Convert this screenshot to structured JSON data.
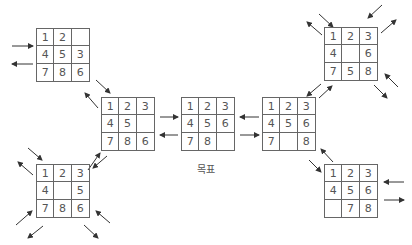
{
  "diagram": {
    "goal_label": "목표",
    "states": [
      {
        "id": "top-left",
        "x": 36,
        "y": 28,
        "cells": [
          "1",
          "2",
          "",
          "4",
          "5",
          "3",
          "7",
          "8",
          "6"
        ]
      },
      {
        "id": "left-middle",
        "x": 101,
        "y": 97,
        "cells": [
          "1",
          "2",
          "3",
          "4",
          "5",
          "",
          "7",
          "8",
          "6"
        ]
      },
      {
        "id": "goal",
        "x": 181,
        "y": 97,
        "cells": [
          "1",
          "2",
          "3",
          "4",
          "5",
          "6",
          "7",
          "8",
          ""
        ]
      },
      {
        "id": "right-middle",
        "x": 262,
        "y": 97,
        "cells": [
          "1",
          "2",
          "3",
          "4",
          "5",
          "6",
          "7",
          "",
          "8"
        ]
      },
      {
        "id": "top-right",
        "x": 324,
        "y": 27,
        "cells": [
          "1",
          "2",
          "3",
          "4",
          "",
          "6",
          "7",
          "5",
          "8"
        ]
      },
      {
        "id": "bottom-left",
        "x": 36,
        "y": 164,
        "cells": [
          "1",
          "2",
          "3",
          "4",
          "",
          "5",
          "7",
          "8",
          "6"
        ]
      },
      {
        "id": "bottom-right",
        "x": 324,
        "y": 164,
        "cells": [
          "1",
          "2",
          "3",
          "4",
          "5",
          "6",
          "",
          "7",
          "8"
        ]
      }
    ],
    "colors": {
      "line": "#666666",
      "text": "#555555",
      "arrow": "#333333"
    }
  }
}
